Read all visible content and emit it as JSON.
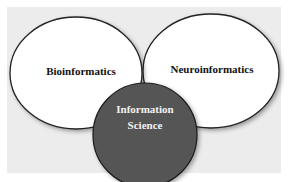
{
  "diagram": {
    "type": "venn",
    "background_color": "#ececec",
    "sets": [
      {
        "id": "bioinformatics",
        "label": "Bioinformatics",
        "fill": "#ffffff",
        "stroke": "#222222",
        "text_color": "#111111"
      },
      {
        "id": "neuroinformatics",
        "label": "Neuroinformatics",
        "fill": "#ffffff",
        "stroke": "#222222",
        "text_color": "#111111"
      },
      {
        "id": "information-science",
        "label_line1": "Information",
        "label_line2": "Science",
        "fill": "#555555",
        "stroke": "#1a1a1a",
        "text_color": "#f2f2f2"
      }
    ]
  }
}
